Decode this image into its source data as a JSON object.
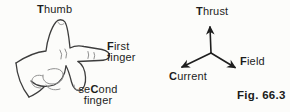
{
  "figure": {
    "caption": "Fig. 66.3",
    "colors": {
      "ink": "#2a2a2a",
      "sketch_ink": "#8f8f8f",
      "background": "#fcfcfa"
    }
  },
  "hand_diagram": {
    "thumb_label": {
      "bold": "T",
      "rest": "humb"
    },
    "first_finger_label": {
      "bold": "F",
      "rest": "irst",
      "line2": "finger"
    },
    "second_finger_label": {
      "pre": "se",
      "bold": "C",
      "post": "ond",
      "line2": "finger"
    }
  },
  "vector_diagram": {
    "thrust_label": {
      "bold": "T",
      "rest": "hrust"
    },
    "current_label": {
      "bold": "C",
      "rest": "urrent"
    },
    "field_label": {
      "bold": "F",
      "rest": "ield"
    }
  }
}
